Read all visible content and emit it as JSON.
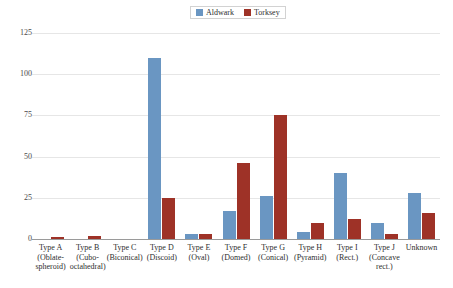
{
  "chart_data": {
    "type": "bar",
    "title": "",
    "xlabel": "",
    "ylabel": "",
    "ylim": [
      0,
      125
    ],
    "yticks": [
      0,
      25,
      50,
      75,
      100,
      125
    ],
    "grid": true,
    "legend_position": "top-center",
    "categories": [
      "Type A (Oblate-spheroid)",
      "Type B (Cubo-octahedral)",
      "Type C (Biconical)",
      "Type D (Discoid)",
      "Type E (Oval)",
      "Type F (Domed)",
      "Type G (Conical)",
      "Type H (Pyramid)",
      "Type I (Rect.)",
      "Type J (Concave rect.)",
      "Unknown"
    ],
    "category_lines": [
      [
        "Type A",
        "(Oblate-",
        "spheroid)"
      ],
      [
        "Type B",
        "(Cubo-",
        "octahedral)"
      ],
      [
        "Type C",
        "(Biconical)"
      ],
      [
        "Type D",
        "(Discoid)"
      ],
      [
        "Type E",
        "(Oval)"
      ],
      [
        "Type F",
        "(Domed)"
      ],
      [
        "Type G",
        "(Conical)"
      ],
      [
        "Type H",
        "(Pyramid)"
      ],
      [
        "Type I",
        "(Rect.)"
      ],
      [
        "Type J",
        "(Concave",
        "rect.)"
      ],
      [
        "Unknown"
      ]
    ],
    "series": [
      {
        "name": "Aldwark",
        "color": "#6a96c2",
        "values": [
          0,
          0,
          0,
          110,
          3,
          17,
          26,
          4,
          40,
          10,
          28
        ]
      },
      {
        "name": "Torksey",
        "color": "#9e3227",
        "values": [
          1,
          2,
          0,
          25,
          3,
          46,
          75,
          10,
          12,
          3,
          16
        ]
      }
    ]
  },
  "legend": {
    "entries": [
      {
        "label": "Aldwark",
        "color": "#6a96c2"
      },
      {
        "label": "Torksey",
        "color": "#9e3227"
      }
    ]
  },
  "caption": {
    "text": ""
  }
}
